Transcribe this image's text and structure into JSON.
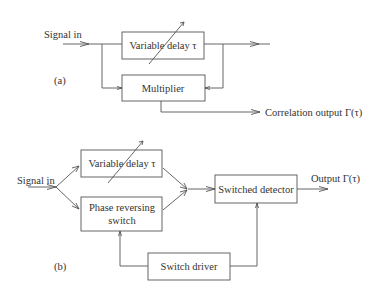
{
  "figure_a": {
    "label": "(a)",
    "input_label": "Signal in",
    "blocks": {
      "variable_delay": "Variable delay τ",
      "multiplier": "Multiplier"
    },
    "output_label": "Correlation output Γ(τ)"
  },
  "figure_b": {
    "label": "(b)",
    "input_label": "Signal in",
    "blocks": {
      "variable_delay": "Variable delay τ",
      "phase_switch_line1": "Phase reversing",
      "phase_switch_line2": "switch",
      "switched_detector": "Switched detector",
      "switch_driver": "Switch driver"
    },
    "output_label": "Output Γ(τ)"
  }
}
